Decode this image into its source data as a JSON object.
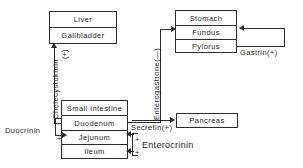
{
  "diagram": {
    "line_color": "#2b2b2b",
    "background": "#ffffff",
    "boxes": [
      {
        "id": "liver_gallbladder",
        "rows": [
          "Liver",
          "Gallbladder"
        ]
      },
      {
        "id": "stomach",
        "rows": [
          "Stomach",
          "Fundus",
          "Pylorus"
        ]
      },
      {
        "id": "small_intestine",
        "rows": [
          "Small intestine",
          "Duodenum",
          "Jejunum",
          "Ileum"
        ]
      },
      {
        "id": "pancreas",
        "rows": [
          "Pancreas"
        ]
      }
    ],
    "labels": {
      "liver": "Liver",
      "gallbladder": "Gallbladder",
      "stomach": "Stomach",
      "fundus": "Fundus",
      "pylorus": "Pylorus",
      "small_intestine": "Small intestine",
      "duodenum": "Duodenum",
      "jejunum": "Jejunum",
      "ileum": "Ileum",
      "pancreas": "Pancreas"
    },
    "hormones": {
      "cholecystokinin": "Cholecystokinin",
      "cholecystokinin_sign": "(+)",
      "enterogastrone": "Enterogastrone(—)",
      "gastrin": "Gastrin(+)",
      "secretin": "Secretin(+)",
      "enterocrinin": "Enterocrinin",
      "duocrinin": "Duocrinin",
      "plus_duocrinin": "+",
      "plus_secretin": "+",
      "plus_enterocrinin": "+"
    }
  }
}
